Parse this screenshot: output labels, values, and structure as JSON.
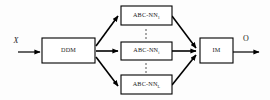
{
  "diagram": {
    "type": "block-flow-diagram",
    "background_color": "#fdfdfd",
    "stroke_color": "#000000",
    "text_color": "#1a1a1a",
    "input": {
      "label": "X",
      "style": "italic"
    },
    "output": {
      "label": "O",
      "style": "upright"
    },
    "nodes": {
      "splitter": {
        "label": "DDM",
        "x": 42,
        "y": 38,
        "width": 53,
        "height": 25
      },
      "merger": {
        "label": "IM",
        "x": 200,
        "y": 38,
        "width": 33,
        "height": 25
      },
      "branches": [
        {
          "base": "ABC-NN",
          "subscript": "1",
          "x": 121,
          "y": 6,
          "width": 51,
          "height": 19
        },
        {
          "base": "ABC-NN",
          "subscript": "i",
          "x": 121,
          "y": 42,
          "width": 51,
          "height": 18
        },
        {
          "base": "ABC-NN",
          "subscript": "L",
          "x": 121,
          "y": 75,
          "width": 51,
          "height": 19
        }
      ]
    },
    "ellipses": [
      {
        "name": "upper-vertical-ellipsis",
        "x": 146,
        "ys": [
          30,
          34,
          38
        ]
      },
      {
        "name": "lower-vertical-ellipsis",
        "x": 146,
        "ys": [
          64,
          68,
          72
        ]
      }
    ]
  }
}
